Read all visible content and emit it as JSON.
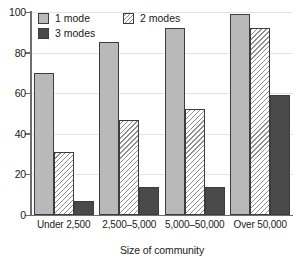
{
  "chart_data": {
    "type": "bar",
    "title": "",
    "subtitle": "",
    "xlabel": "Size of community",
    "ylabel": "",
    "categories": [
      "Under 2,500",
      "2,500–5,000",
      "5,000–50,000",
      "Over 50,000"
    ],
    "series": [
      {
        "name": "1 mode",
        "values": [
          70,
          85,
          92,
          99
        ],
        "color": "#b9b9b9",
        "fill": "solid-light-gray"
      },
      {
        "name": "2 modes",
        "values": [
          31,
          47,
          52,
          92
        ],
        "color": "#ffffff",
        "fill": "diagonal-hatch"
      },
      {
        "name": "3 modes",
        "values": [
          7,
          14,
          14,
          59
        ],
        "color": "#4a4a4a",
        "fill": "solid-dark-gray"
      }
    ],
    "ylim": [
      0,
      100
    ],
    "yticks": [
      0,
      20,
      40,
      60,
      80,
      100
    ],
    "ytick_labels": [
      "0",
      "20",
      "40",
      "60",
      "80",
      "100"
    ],
    "grid": true,
    "grid_axis": "y",
    "legend_position": "top-left-inside",
    "legend_layout": "2-columns"
  },
  "axes": {
    "y": {
      "ticks": [
        {
          "label": "100",
          "value": 100
        },
        {
          "label": "80",
          "value": 80
        },
        {
          "label": "60",
          "value": 60
        },
        {
          "label": "40",
          "value": 40
        },
        {
          "label": "20",
          "value": 20
        },
        {
          "label": "0",
          "value": 0
        }
      ]
    },
    "x": {
      "title": "Size of community",
      "ticks": [
        {
          "label": "Under 2,500"
        },
        {
          "label": "2,500–5,000"
        },
        {
          "label": "5,000–50,000"
        },
        {
          "label": "Over 50,000"
        }
      ]
    }
  },
  "legend": {
    "entries": [
      {
        "label": "1 mode"
      },
      {
        "label": "2 modes"
      },
      {
        "label": "3 modes"
      }
    ]
  }
}
